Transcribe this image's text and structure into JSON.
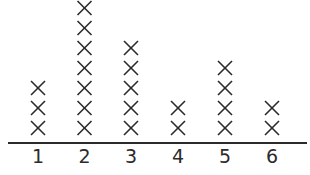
{
  "chart_data": {
    "type": "dot-plot",
    "title": "",
    "xlabel": "",
    "ylabel": "",
    "marker": "X",
    "categories": [
      "1",
      "2",
      "3",
      "4",
      "5",
      "6"
    ],
    "values": [
      3,
      7,
      5,
      2,
      4,
      2
    ],
    "grid": false,
    "legend": null,
    "color": "#2b2b2b"
  }
}
